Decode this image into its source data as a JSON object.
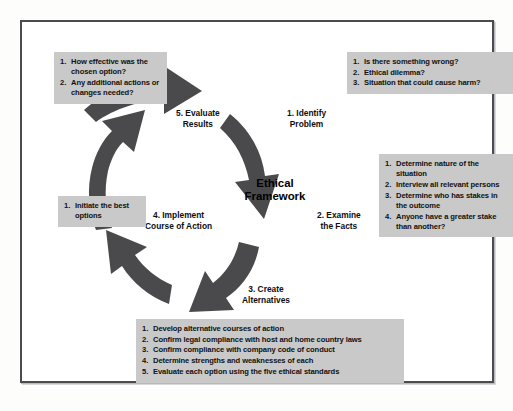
{
  "diagram": {
    "center_title_line1": "Ethical",
    "center_title_line2": "Framework",
    "nodes": [
      {
        "id": "identify",
        "line1": "1. Identify",
        "line2": "Problem"
      },
      {
        "id": "facts",
        "line1": "2. Examine",
        "line2": "the Facts"
      },
      {
        "id": "create",
        "line1": "3. Create",
        "line2": "Alternatives"
      },
      {
        "id": "implement",
        "line1": "4. Implement",
        "line2": "Course of Action"
      },
      {
        "id": "evaluate",
        "line1": "5. Evaluate",
        "line2": "Results"
      }
    ],
    "callouts": {
      "identify": [
        "Is there something wrong?",
        "Ethical dilemma?",
        "Situation that could cause harm?"
      ],
      "facts": [
        "Determine nature of the situation",
        "Interview all relevant persons",
        "Determine who has stakes in the outcome",
        "Anyone have a greater stake than another?"
      ],
      "create": [
        "Develop alternative courses of action",
        "Confirm legal compliance with host and home country laws",
        "Confirm compliance with company code of conduct",
        "Determine strengths and weaknesses of each",
        "Evaluate each option using the five ethical standards"
      ],
      "implement": [
        "Initiate the best options"
      ],
      "evaluate": [
        "How effective was the chosen option?",
        "Any additional actions or changes needed?"
      ]
    },
    "colors": {
      "callout_background": "#c9c9c9",
      "arrow_fill": "#4a4a4c",
      "frame_border": "#4b4b50",
      "text": "#111111"
    }
  }
}
